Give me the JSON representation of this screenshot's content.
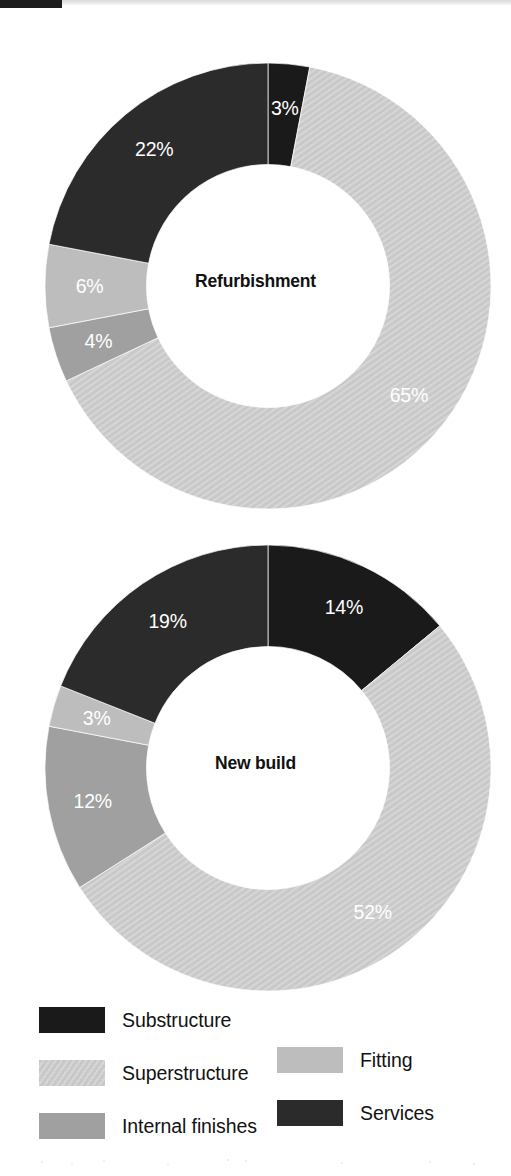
{
  "colors": {
    "substructure": "#1a1a1a",
    "superstructure": "#c8c8c8",
    "superstructure_hatch": "#d6d6d6",
    "internal_finishes": "#a0a0a0",
    "fitting": "#bdbdbd",
    "services": "#2b2b2b",
    "slice_label_light": "#ffffff",
    "page_background": "#ffffff"
  },
  "legend": {
    "left_column": [
      {
        "label": "Substructure",
        "swatch": "substructure",
        "pattern": "solid"
      },
      {
        "label": "Superstructure",
        "swatch": "superstructure",
        "pattern": "diagonal-hatch"
      },
      {
        "label": "Internal finishes",
        "swatch": "internal_finishes",
        "pattern": "solid"
      }
    ],
    "right_column": [
      {
        "label": "Fitting",
        "swatch": "fitting",
        "pattern": "solid"
      },
      {
        "label": "Services",
        "swatch": "services",
        "pattern": "solid"
      }
    ]
  },
  "chart_data": [
    {
      "type": "pie",
      "variant": "donut",
      "title": "Refurbishment",
      "center_label": "Refurbishment",
      "unit": "%",
      "start_angle_deg": 0,
      "direction": "clockwise",
      "inner_radius_ratio": 0.545,
      "categories": [
        "Substructure",
        "Superstructure",
        "Internal finishes",
        "Fitting",
        "Services"
      ],
      "values": [
        3,
        65,
        4,
        6,
        22
      ],
      "slices": [
        {
          "label": "Substructure",
          "value": 3,
          "display": "3%",
          "color": "substructure",
          "pattern": "solid",
          "label_color": "light"
        },
        {
          "label": "Superstructure",
          "value": 65,
          "display": "65%",
          "color": "superstructure",
          "pattern": "diagonal-hatch",
          "label_color": "light"
        },
        {
          "label": "Internal finishes",
          "value": 4,
          "display": "4%",
          "color": "internal_finishes",
          "pattern": "solid",
          "label_color": "light"
        },
        {
          "label": "Fitting",
          "value": 6,
          "display": "6%",
          "color": "fitting",
          "pattern": "solid",
          "label_color": "light"
        },
        {
          "label": "Services",
          "value": 22,
          "display": "22%",
          "color": "services",
          "pattern": "solid",
          "label_color": "light"
        }
      ]
    },
    {
      "type": "pie",
      "variant": "donut",
      "title": "New build",
      "center_label": "New build",
      "unit": "%",
      "start_angle_deg": 0,
      "direction": "clockwise",
      "inner_radius_ratio": 0.545,
      "categories": [
        "Substructure",
        "Superstructure",
        "Internal finishes",
        "Fitting",
        "Services"
      ],
      "values": [
        14,
        52,
        12,
        3,
        19
      ],
      "slices": [
        {
          "label": "Substructure",
          "value": 14,
          "display": "14%",
          "color": "substructure",
          "pattern": "solid",
          "label_color": "light"
        },
        {
          "label": "Superstructure",
          "value": 52,
          "display": "52%",
          "color": "superstructure",
          "pattern": "diagonal-hatch",
          "label_color": "light"
        },
        {
          "label": "Internal finishes",
          "value": 12,
          "display": "12%",
          "color": "internal_finishes",
          "pattern": "solid",
          "label_color": "light"
        },
        {
          "label": "Fitting",
          "value": 3,
          "display": "3%",
          "color": "fitting",
          "pattern": "solid",
          "label_color": "light"
        },
        {
          "label": "Services",
          "value": 19,
          "display": "19%",
          "color": "services",
          "pattern": "solid",
          "label_color": "light"
        }
      ]
    }
  ]
}
